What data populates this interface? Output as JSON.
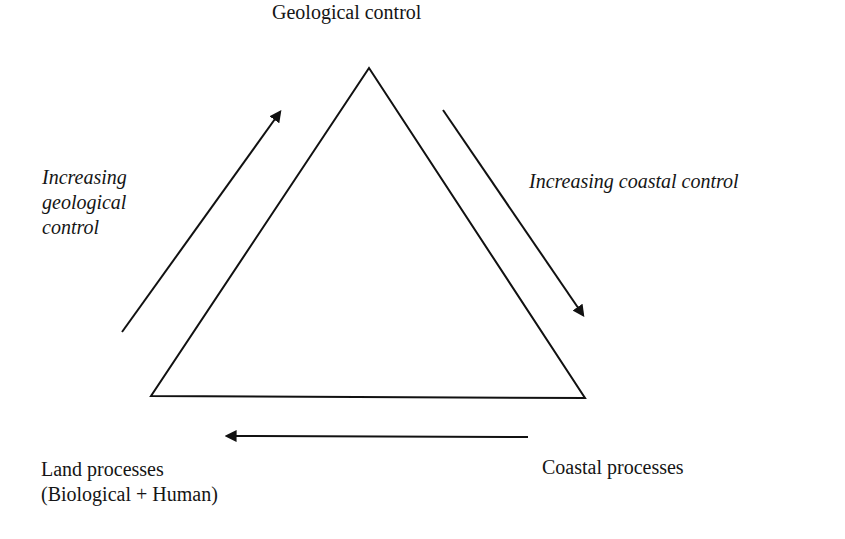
{
  "diagram": {
    "type": "triangle-concept-diagram",
    "vertices": {
      "top": {
        "label": "Geological control"
      },
      "bottom_left": {
        "label_line1": "Land processes",
        "label_line2": "(Biological + Human)"
      },
      "bottom_right": {
        "label": "Coastal processes"
      }
    },
    "arrows": {
      "left": {
        "direction": "up-right toward Geological control",
        "label_lines": [
          "Increasing",
          "geological",
          "control"
        ]
      },
      "right": {
        "direction": "down-right toward Coastal processes",
        "label": "Increasing coastal control"
      },
      "bottom": {
        "direction": "leftward toward Land processes"
      }
    },
    "colors": {
      "line": "#111111",
      "background": "#ffffff"
    }
  }
}
